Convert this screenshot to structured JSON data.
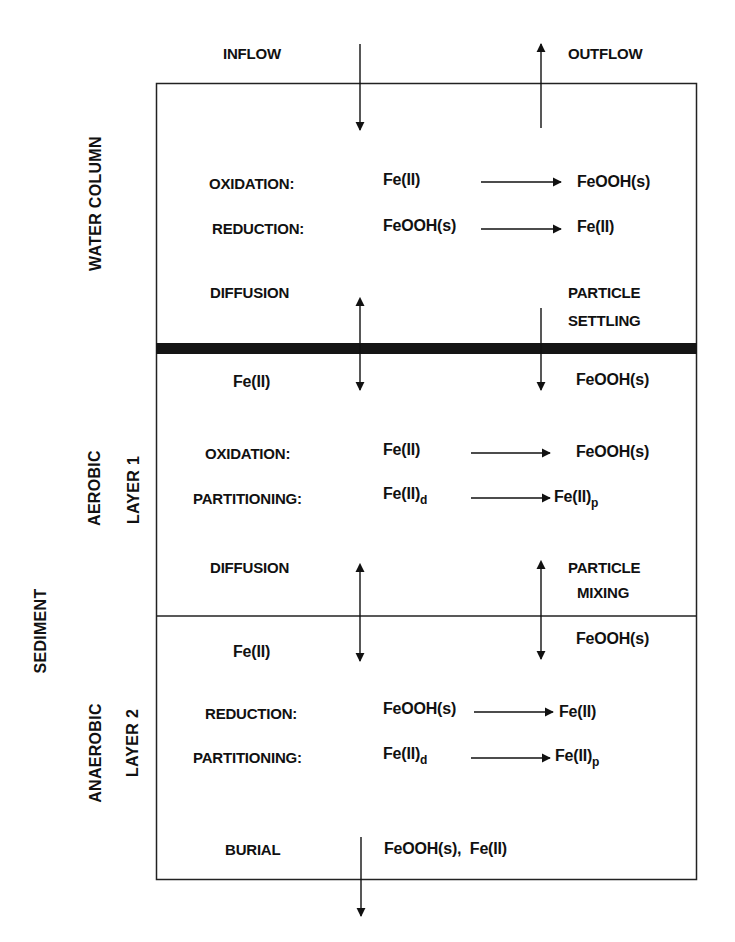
{
  "diagram": {
    "type": "iron cycling compartment model",
    "top_labels": {
      "inflow": "INFLOW",
      "outflow": "OUTFLOW"
    },
    "side_labels": {
      "water_column": "WATER COLUMN",
      "sediment": "SEDIMENT",
      "aerobic": "AEROBIC",
      "layer1": "LAYER 1",
      "anaerobic": "ANAEROBIC",
      "layer2": "LAYER 2"
    },
    "water_column": {
      "oxidation": {
        "label": "OXIDATION:",
        "from": "Fe(II)",
        "to": "FeOOH(s)"
      },
      "reduction": {
        "label": "REDUCTION:",
        "from": "FeOOH(s)",
        "to": "Fe(II)"
      },
      "diffusion": "DIFFUSION",
      "settling_1": "PARTICLE",
      "settling_2": "SETTLING"
    },
    "layer1": {
      "fe_dissolved": "Fe(II)",
      "feooh": "FeOOH(s)",
      "oxidation": {
        "label": "OXIDATION:",
        "from": "Fe(II)",
        "to": "FeOOH(s)"
      },
      "partitioning": {
        "label": "PARTITIONING:",
        "from": "Fe(II)",
        "from_sub": "d",
        "to": "Fe(II)",
        "to_sub": "p"
      },
      "diffusion": "DIFFUSION",
      "mixing_1": "PARTICLE",
      "mixing_2": "MIXING"
    },
    "layer2": {
      "fe_dissolved": "Fe(II)",
      "feooh": "FeOOH(s)",
      "reduction": {
        "label": "REDUCTION:",
        "from": "FeOOH(s)",
        "to": "Fe(II)"
      },
      "partitioning": {
        "label": "PARTITIONING:",
        "from": "Fe(II)",
        "from_sub": "d",
        "to": "Fe(II)",
        "to_sub": "p"
      },
      "burial": {
        "label": "BURIAL",
        "species": "FeOOH(s),  Fe(II)"
      }
    },
    "colors": {
      "ink": "#111111",
      "background": "#ffffff"
    }
  }
}
